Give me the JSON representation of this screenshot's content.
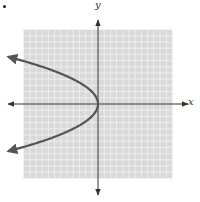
{
  "chart_data": {
    "type": "line",
    "title": "",
    "xlabel": "x",
    "ylabel": "y",
    "equation": "x = -y^2/4",
    "grid": true,
    "xlim": [
      -12,
      12
    ],
    "ylim": [
      -12,
      12
    ],
    "series": [
      {
        "name": "parabola",
        "color": "#555555",
        "points": [
          [
            -14,
            -7.5
          ],
          [
            -9,
            -6
          ],
          [
            -4,
            -4
          ],
          [
            -1,
            -2
          ],
          [
            0,
            0
          ],
          [
            -1,
            2
          ],
          [
            -4,
            4
          ],
          [
            -9,
            6
          ],
          [
            -14,
            7.5
          ]
        ],
        "arrows_at_ends": true
      }
    ]
  },
  "labels": {
    "x": "x",
    "y": "y"
  },
  "colors": {
    "grid_bg": "#d9d9d9",
    "grid_line": "#f2f2f2",
    "axis": "#333333",
    "curve": "#555555"
  }
}
